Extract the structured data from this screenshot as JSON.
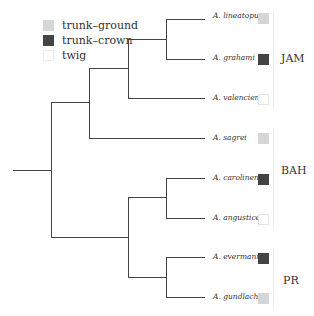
{
  "legend": [
    {
      "label": "trunk–ground",
      "color": "#d6d6d6"
    },
    {
      "label": "trunk–crown",
      "color": "#444444"
    },
    {
      "label": "twig",
      "color": "#ffffff"
    }
  ],
  "taxa": [
    {
      "name": "A. lineatopus",
      "ecomorph": "trunk–ground",
      "color": "#d6d6d6",
      "y": 16
    },
    {
      "name": "A. grahami",
      "ecomorph": "trunk–crown",
      "color": "#444444",
      "y": 58
    },
    {
      "name": "A. valencienni",
      "ecomorph": "twig",
      "color": "#ffffff",
      "y": 98
    },
    {
      "name": "A. sagrei",
      "ecomorph": "trunk–ground",
      "color": "#d6d6d6",
      "y": 138
    },
    {
      "name": "A. carolinensis",
      "ecomorph": "trunk–crown",
      "color": "#444444",
      "y": 178
    },
    {
      "name": "A. angusticeps",
      "ecomorph": "twig",
      "color": "#ffffff",
      "y": 218
    },
    {
      "name": "A. evermanni",
      "ecomorph": "trunk–crown",
      "color": "#444444",
      "y": 258
    },
    {
      "name": "A. gundlachi",
      "ecomorph": "trunk–ground",
      "color": "#d6d6d6",
      "y": 297
    }
  ],
  "regions": [
    {
      "label": "JAM",
      "y": 57
    },
    {
      "label": "BAH",
      "y": 165
    },
    {
      "label": "PR",
      "y": 275
    }
  ]
}
